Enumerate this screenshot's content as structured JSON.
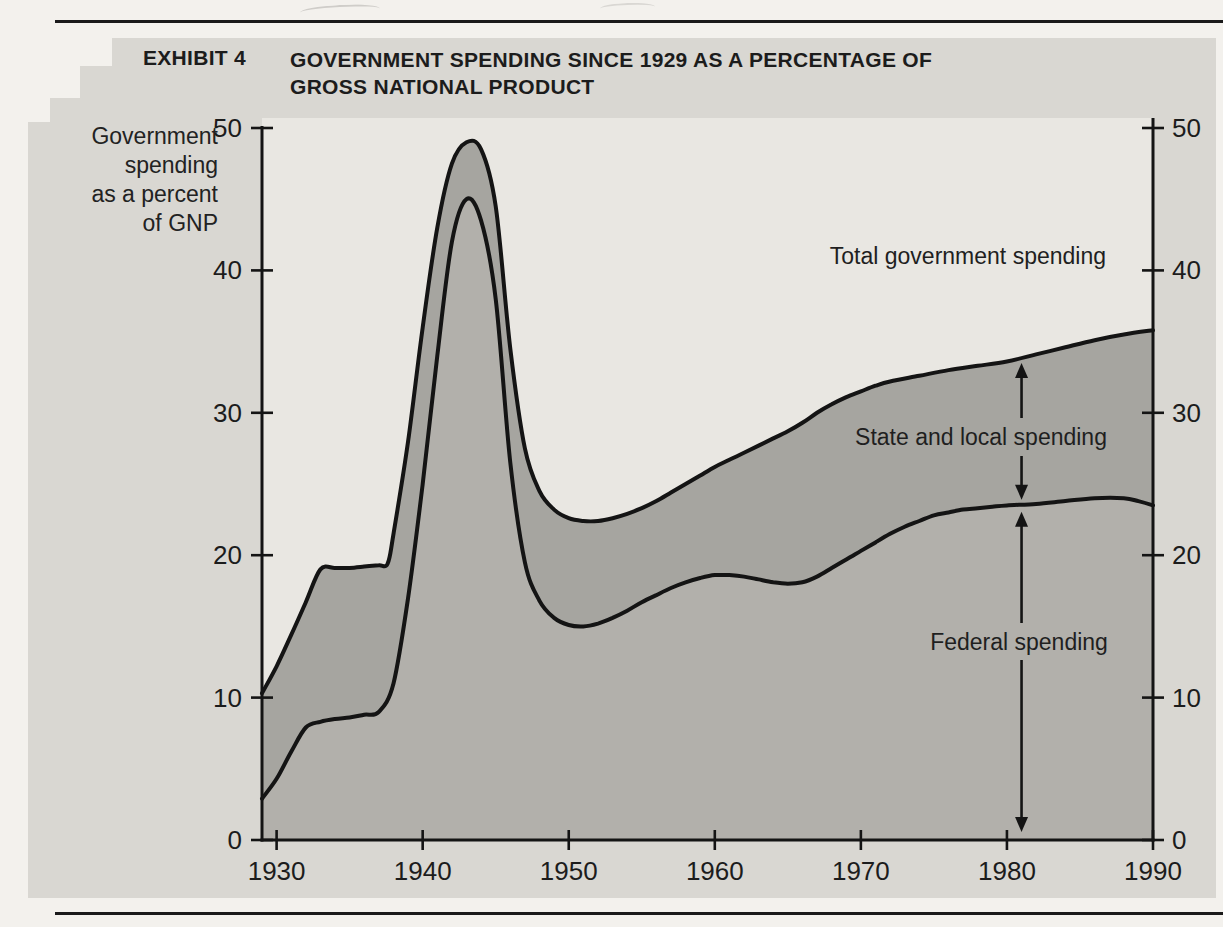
{
  "header": {
    "exhibit": "EXHIBIT 4",
    "title_line1": "GOVERNMENT SPENDING SINCE 1929 AS A PERCENTAGE OF",
    "title_line2": "GROSS NATIONAL PRODUCT"
  },
  "y_axis_label": [
    "Government",
    "spending",
    "as a percent",
    "of GNP"
  ],
  "colors": {
    "page_bg": "#f3f1ed",
    "panel_bg": "#d9d7d2",
    "plot_bg": "#e9e7e2",
    "band_state_local": "#a6a5a0",
    "area_federal": "#b2b0ab",
    "line": "#141414",
    "rule": "#1a1a1a",
    "ink": "#1c1c1c"
  },
  "chart_data": {
    "type": "area",
    "title": "Government spending since 1929 as a percentage of Gross National Product",
    "xlabel": "Year",
    "ylabel": "Government spending as a percent of GNP",
    "xlim": [
      1929,
      1990
    ],
    "ylim": [
      0,
      50
    ],
    "x_ticks": [
      1930,
      1940,
      1950,
      1960,
      1970,
      1980,
      1990
    ],
    "y_ticks": [
      0,
      10,
      20,
      30,
      40,
      50
    ],
    "grid": false,
    "y_axis_sides": "both",
    "legend_position": "inline-annotations",
    "series": [
      {
        "name": "Total government spending",
        "x": [
          1929,
          1930,
          1931,
          1932,
          1933,
          1934,
          1935,
          1936,
          1937,
          1937.6,
          1938,
          1939,
          1940,
          1941,
          1942,
          1943,
          1944,
          1945,
          1946,
          1947,
          1948,
          1949,
          1950,
          1951,
          1952,
          1953,
          1954,
          1955,
          1956,
          1957,
          1958,
          1959,
          1960,
          1961,
          1962,
          1963,
          1964,
          1965,
          1966,
          1967,
          1968,
          1969,
          1970,
          1971,
          1972,
          1974,
          1976,
          1978,
          1980,
          1982,
          1984,
          1986,
          1988,
          1990
        ],
        "values": [
          10.3,
          12.2,
          14.4,
          16.7,
          19,
          19.1,
          19.1,
          19.2,
          19.3,
          19.4,
          21.5,
          28,
          36,
          43,
          47.5,
          49,
          48.5,
          44.5,
          34.5,
          27.5,
          24.5,
          23.2,
          22.6,
          22.4,
          22.4,
          22.6,
          22.9,
          23.3,
          23.8,
          24.4,
          25,
          25.6,
          26.2,
          26.7,
          27.2,
          27.7,
          28.2,
          28.7,
          29.3,
          30,
          30.6,
          31.1,
          31.5,
          31.9,
          32.2,
          32.6,
          33,
          33.3,
          33.6,
          34.1,
          34.6,
          35.1,
          35.5,
          35.8
        ]
      },
      {
        "name": "Federal spending",
        "x": [
          1929,
          1930,
          1931,
          1932,
          1933,
          1934,
          1935,
          1936,
          1937,
          1938,
          1939,
          1940,
          1941,
          1942,
          1943,
          1944,
          1945,
          1946,
          1947,
          1948,
          1949,
          1950,
          1951,
          1952,
          1953,
          1954,
          1955,
          1956,
          1957,
          1958,
          1959,
          1960,
          1961,
          1962,
          1963,
          1964,
          1965,
          1966,
          1967,
          1968,
          1969,
          1970,
          1971,
          1972,
          1973,
          1974,
          1975,
          1976,
          1977,
          1978,
          1979,
          1980,
          1982,
          1984,
          1986,
          1988,
          1989,
          1990
        ],
        "values": [
          2.9,
          4.3,
          6.2,
          7.9,
          8.3,
          8.5,
          8.6,
          8.8,
          9,
          11,
          17,
          25,
          34,
          42,
          45,
          43.5,
          38,
          26.5,
          19.5,
          16.8,
          15.6,
          15.1,
          15,
          15.2,
          15.6,
          16.1,
          16.7,
          17.2,
          17.7,
          18.1,
          18.4,
          18.6,
          18.6,
          18.5,
          18.3,
          18.1,
          18,
          18.1,
          18.5,
          19.1,
          19.7,
          20.3,
          20.9,
          21.5,
          22,
          22.4,
          22.8,
          23,
          23.2,
          23.3,
          23.4,
          23.5,
          23.6,
          23.8,
          24,
          24,
          23.8,
          23.5
        ]
      }
    ],
    "annotations": {
      "total": "Total government spending",
      "state_local": "State and local spending",
      "federal": "Federal spending"
    },
    "arrow_x": 1981
  }
}
